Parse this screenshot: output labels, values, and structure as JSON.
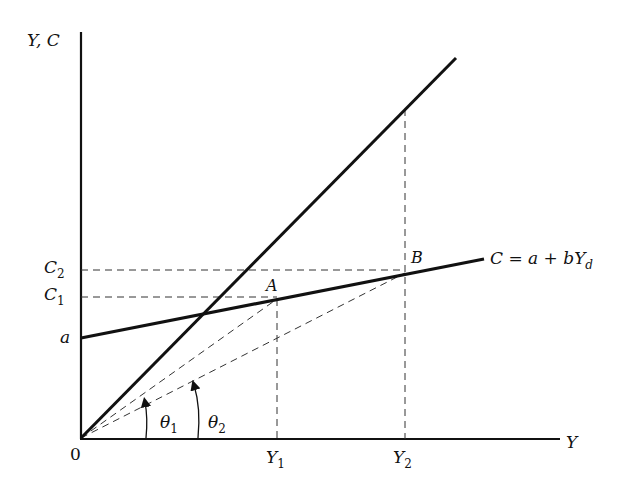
{
  "diagram": {
    "type": "consumption-function",
    "axes": {
      "y_label": "Y, C",
      "x_label": "Y",
      "origin_label": "0"
    },
    "y_ticks": {
      "c2": "C",
      "c2_sub": "2",
      "c1": "C",
      "c1_sub": "1",
      "a": "a"
    },
    "x_ticks": {
      "y1": "Y",
      "y1_sub": "1",
      "y2": "Y",
      "y2_sub": "2"
    },
    "points": {
      "a_label": "A",
      "b_label": "B"
    },
    "consumption_line": {
      "label_main": "C = a + bY",
      "label_sub": "d"
    },
    "angles": {
      "theta1": "θ",
      "theta1_sub": "1",
      "theta2": "θ",
      "theta2_sub": "2"
    },
    "colors": {
      "ink": "#111111",
      "background": "#ffffff"
    }
  }
}
